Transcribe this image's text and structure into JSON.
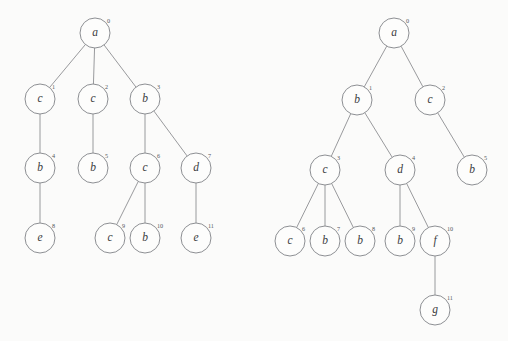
{
  "figure": {
    "background_color": "#fbfbfa",
    "stroke_color": "#87898d",
    "label_color": "#3a3c40",
    "index_color": "#55585c",
    "node_radius": 15,
    "width": 508,
    "height": 341
  },
  "trees": [
    {
      "name": "left-tree",
      "root_index": 0,
      "nodes": [
        {
          "id": 0,
          "label": "a",
          "index": "0",
          "x": 95,
          "y": 33
        },
        {
          "id": 1,
          "label": "c",
          "index": "1",
          "x": 40,
          "y": 99
        },
        {
          "id": 2,
          "label": "c",
          "index": "2",
          "x": 93,
          "y": 99
        },
        {
          "id": 3,
          "label": "b",
          "index": "3",
          "x": 145,
          "y": 99
        },
        {
          "id": 4,
          "label": "b",
          "index": "4",
          "x": 40,
          "y": 168
        },
        {
          "id": 5,
          "label": "b",
          "index": "5",
          "x": 93,
          "y": 168
        },
        {
          "id": 6,
          "label": "c",
          "index": "6",
          "x": 145,
          "y": 168
        },
        {
          "id": 7,
          "label": "d",
          "index": "7",
          "x": 196,
          "y": 168
        },
        {
          "id": 8,
          "label": "e",
          "index": "8",
          "x": 40,
          "y": 238
        },
        {
          "id": 9,
          "label": "c",
          "index": "9",
          "x": 110,
          "y": 238
        },
        {
          "id": 10,
          "label": "b",
          "index": "10",
          "x": 145,
          "y": 238
        },
        {
          "id": 11,
          "label": "e",
          "index": "11",
          "x": 196,
          "y": 238
        }
      ],
      "edges": [
        {
          "from": 0,
          "to": 1
        },
        {
          "from": 0,
          "to": 2
        },
        {
          "from": 0,
          "to": 3
        },
        {
          "from": 1,
          "to": 4
        },
        {
          "from": 2,
          "to": 5
        },
        {
          "from": 3,
          "to": 6
        },
        {
          "from": 3,
          "to": 7
        },
        {
          "from": 4,
          "to": 8
        },
        {
          "from": 6,
          "to": 9
        },
        {
          "from": 6,
          "to": 10
        },
        {
          "from": 7,
          "to": 11
        }
      ]
    },
    {
      "name": "right-tree",
      "root_index": 0,
      "nodes": [
        {
          "id": 0,
          "label": "a",
          "index": "0",
          "x": 394,
          "y": 33
        },
        {
          "id": 1,
          "label": "b",
          "index": "1",
          "x": 357,
          "y": 100
        },
        {
          "id": 2,
          "label": "c",
          "index": "2",
          "x": 430,
          "y": 100
        },
        {
          "id": 3,
          "label": "c",
          "index": "3",
          "x": 325,
          "y": 170
        },
        {
          "id": 4,
          "label": "d",
          "index": "4",
          "x": 400,
          "y": 170
        },
        {
          "id": 5,
          "label": "b",
          "index": "5",
          "x": 472,
          "y": 170
        },
        {
          "id": 6,
          "label": "c",
          "index": "6",
          "x": 290,
          "y": 241
        },
        {
          "id": 7,
          "label": "b",
          "index": "7",
          "x": 325,
          "y": 241
        },
        {
          "id": 8,
          "label": "b",
          "index": "8",
          "x": 360,
          "y": 241
        },
        {
          "id": 9,
          "label": "b",
          "index": "9",
          "x": 400,
          "y": 241
        },
        {
          "id": 10,
          "label": "f",
          "index": "10",
          "x": 435,
          "y": 241
        },
        {
          "id": 11,
          "label": "g",
          "index": "11",
          "x": 435,
          "y": 310
        }
      ],
      "edges": [
        {
          "from": 0,
          "to": 1
        },
        {
          "from": 0,
          "to": 2
        },
        {
          "from": 1,
          "to": 3
        },
        {
          "from": 1,
          "to": 4
        },
        {
          "from": 2,
          "to": 5
        },
        {
          "from": 3,
          "to": 6
        },
        {
          "from": 3,
          "to": 7
        },
        {
          "from": 3,
          "to": 8
        },
        {
          "from": 4,
          "to": 9
        },
        {
          "from": 4,
          "to": 10
        },
        {
          "from": 10,
          "to": 11
        }
      ]
    }
  ]
}
